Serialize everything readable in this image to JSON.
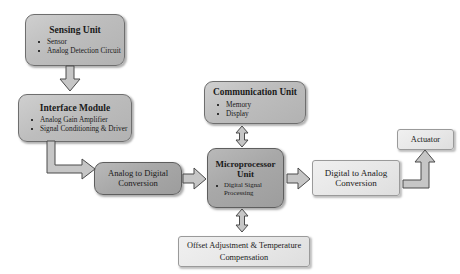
{
  "diagram": {
    "background_color": "#ffffff",
    "node_fill_gray": "#bdbdbd",
    "node_fill_dark_gray": "#a8a8a8",
    "node_fill_light": "#e6e6e6",
    "arrow_fill": "#c6c6c6",
    "arrow_stroke": "#4a4a4a"
  },
  "nodes": {
    "sensing_unit": {
      "title": "Sensing Unit",
      "items": [
        "Sensor",
        "Analog Detection Circuit"
      ]
    },
    "interface_module": {
      "title": "Interface Module",
      "items": [
        "Analog Gain Amplifier",
        "Signal Conditioning & Driver"
      ]
    },
    "analog_to_digital": {
      "title": "Analog to Digital Conversion"
    },
    "communication_unit": {
      "title": "Communication Unit",
      "items": [
        "Memory",
        "Display"
      ]
    },
    "microprocessor_unit": {
      "title": "Microprocessor Unit",
      "items": [
        "Digital Signal Processing"
      ]
    },
    "digital_to_analog": {
      "title": "Digital to Analog Conversion"
    },
    "actuator": {
      "title": "Actuator"
    },
    "offset_compensation": {
      "title": "Offset Adjustment & Temperature Compensation"
    }
  },
  "arrows": [
    {
      "name": "sensing-to-interface",
      "from": "sensing_unit",
      "to": "interface_module",
      "direction": "down",
      "style": "block"
    },
    {
      "name": "interface-to-adc",
      "from": "interface_module",
      "to": "analog_to_digital",
      "direction": "down-right",
      "style": "elbow"
    },
    {
      "name": "adc-to-mpu",
      "from": "analog_to_digital",
      "to": "microprocessor_unit",
      "direction": "right",
      "style": "block"
    },
    {
      "name": "comm-to-mpu",
      "from": "communication_unit",
      "to": "microprocessor_unit",
      "direction": "bidirectional-vertical",
      "style": "block"
    },
    {
      "name": "mpu-to-dac",
      "from": "microprocessor_unit",
      "to": "digital_to_analog",
      "direction": "right",
      "style": "block"
    },
    {
      "name": "dac-to-actuator",
      "from": "digital_to_analog",
      "to": "actuator",
      "direction": "right-up",
      "style": "elbow"
    },
    {
      "name": "mpu-to-offset",
      "from": "microprocessor_unit",
      "to": "offset_compensation",
      "direction": "bidirectional-vertical",
      "style": "block"
    }
  ]
}
